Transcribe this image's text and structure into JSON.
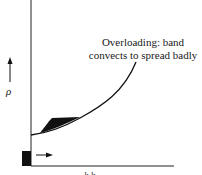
{
  "figure": {
    "annotation": {
      "line1": "Overloading:  band",
      "line2": "convects to spread badly"
    },
    "y_axis_label": "ρ",
    "x_axis_label": "h  h",
    "colors": {
      "ink": "#111111",
      "background": "#ffffff"
    }
  }
}
